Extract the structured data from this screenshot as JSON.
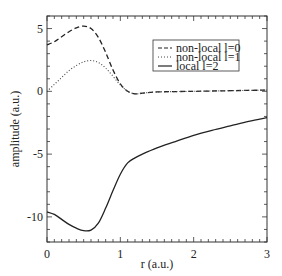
{
  "chart_data": {
    "type": "line",
    "title": "",
    "xlabel": "r (a.u.)",
    "ylabel": "amplitude (a.u.)",
    "xlim": [
      0,
      3
    ],
    "ylim": [
      -12,
      6
    ],
    "xticks": [
      0,
      1,
      2,
      3
    ],
    "yticks": [
      5,
      0,
      -5,
      -10
    ],
    "xtick_labels": [
      "0",
      "1",
      "2",
      "3"
    ],
    "ytick_labels": [
      "5",
      "0",
      "-5",
      "-10"
    ],
    "grid": false,
    "legend_position": "upper right",
    "series": [
      {
        "name": "non-local l=0",
        "style": "dashed",
        "x": [
          0,
          0.1,
          0.2,
          0.3,
          0.4,
          0.5,
          0.6,
          0.7,
          0.8,
          0.9,
          1.0,
          1.1,
          1.2,
          1.3,
          1.5,
          2.0,
          2.5,
          3.0
        ],
        "values": [
          3.7,
          3.95,
          4.35,
          4.75,
          5.05,
          5.2,
          5.0,
          4.3,
          3.1,
          1.7,
          0.6,
          0.0,
          -0.2,
          -0.15,
          -0.05,
          0.0,
          0.05,
          0.1
        ]
      },
      {
        "name": "non-local l=1",
        "style": "dotted",
        "x": [
          0,
          0.1,
          0.2,
          0.3,
          0.4,
          0.5,
          0.6,
          0.7,
          0.8,
          0.9,
          1.0,
          1.1,
          1.2,
          1.3,
          1.5,
          2.0,
          2.5,
          3.0
        ],
        "values": [
          0.0,
          0.55,
          1.1,
          1.65,
          2.05,
          2.35,
          2.45,
          2.3,
          1.85,
          1.2,
          0.5,
          0.0,
          -0.2,
          -0.15,
          -0.05,
          0.0,
          0.05,
          0.1
        ]
      },
      {
        "name": "local l=2",
        "style": "solid",
        "x": [
          0,
          0.1,
          0.2,
          0.3,
          0.4,
          0.5,
          0.6,
          0.7,
          0.8,
          0.9,
          1.0,
          1.1,
          1.2,
          1.3,
          1.5,
          1.75,
          2.0,
          2.25,
          2.5,
          2.75,
          3.0
        ],
        "values": [
          -9.6,
          -9.8,
          -10.2,
          -10.6,
          -10.9,
          -11.1,
          -11.05,
          -10.5,
          -9.3,
          -7.9,
          -6.6,
          -5.7,
          -5.3,
          -5.0,
          -4.5,
          -4.0,
          -3.5,
          -3.1,
          -2.75,
          -2.4,
          -2.1
        ]
      }
    ]
  },
  "legend": {
    "items": [
      {
        "label": "non-local l=0"
      },
      {
        "label": "non-local l=1"
      },
      {
        "label": "local l=2"
      }
    ]
  }
}
